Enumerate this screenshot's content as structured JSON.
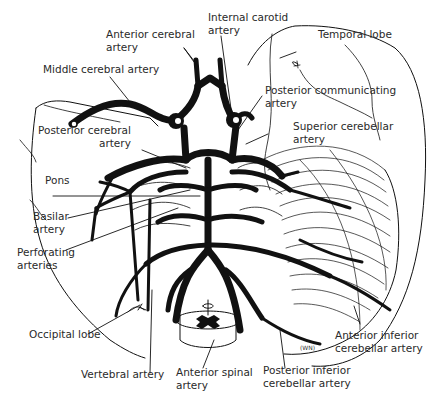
{
  "diagram": {
    "signature": "(WN)",
    "colors": {
      "ink": "#111111",
      "label": "#2a2a2a",
      "background": "#ffffff"
    },
    "labels": {
      "anterior_cerebral": {
        "line1": "Anterior cerebral",
        "line2": "artery"
      },
      "internal_carotid": {
        "line1": "Internal carotid",
        "line2": "artery"
      },
      "temporal_lobe": {
        "line1": "Temporal lobe"
      },
      "middle_cerebral": {
        "line1": "Middle cerebral artery"
      },
      "posterior_communicating": {
        "line1": "Posterior communicating",
        "line2": "artery"
      },
      "posterior_cerebral": {
        "line1": "Posterior cerebral",
        "line2": "artery"
      },
      "superior_cerebellar": {
        "line1": "Superior cerebellar",
        "line2": "artery"
      },
      "pons": {
        "line1": "Pons"
      },
      "basilar": {
        "line1": "Basilar",
        "line2": "artery"
      },
      "perforating": {
        "line1": "Perforating",
        "line2": "arteries"
      },
      "occipital_lobe": {
        "line1": "Occipital lobe"
      },
      "vertebral": {
        "line1": "Vertebral artery"
      },
      "anterior_spinal": {
        "line1": "Anterior spinal",
        "line2": "artery"
      },
      "posterior_inferior_cerebellar": {
        "line1": "Posterior inferior",
        "line2": "cerebellar artery"
      },
      "anterior_inferior_cerebellar": {
        "line1": "Anterior inferior",
        "line2": "cerebellar artery"
      }
    }
  }
}
